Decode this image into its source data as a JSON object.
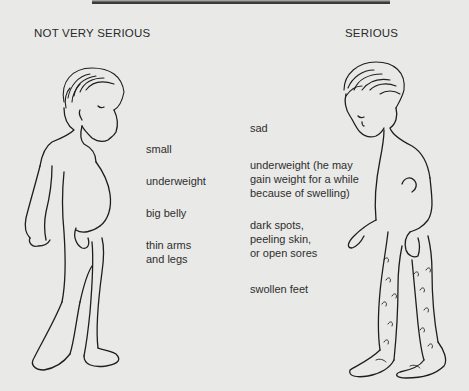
{
  "page": {
    "headings": {
      "left": "NOT VERY SERIOUS",
      "right": "SERIOUS"
    },
    "not_very_serious": {
      "signs": [
        "small",
        "underweight",
        "big belly",
        "thin arms\nand legs"
      ]
    },
    "serious": {
      "signs": [
        "sad",
        "underweight (he may\ngain weight for a while\nbecause of swelling)",
        "dark spots,\npeeling skin,\nor open sores",
        "swollen feet"
      ]
    },
    "figures": {
      "left": "child-mild-malnutrition-illustration",
      "right": "child-severe-malnutrition-illustration"
    },
    "colors": {
      "paper": "#e9e9e7",
      "ink": "#1e1e1e",
      "rule": "#3a3a3a"
    }
  }
}
